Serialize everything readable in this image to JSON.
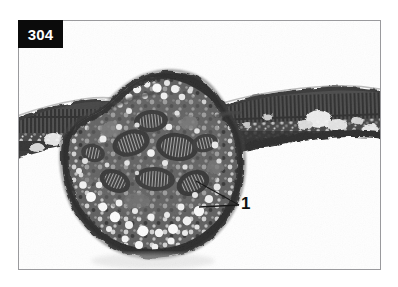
{
  "figure": {
    "number_badge": "304",
    "caption_annotations": [
      {
        "id": "1",
        "label": "1",
        "x": 241,
        "y": 195
      }
    ],
    "colors": {
      "badge_background": "#0b0b0b",
      "badge_text": "#ffffff",
      "frame_border": "#9a9a9d",
      "background": "#ffffff",
      "tissue_dark": "#141414",
      "tissue_mid": "#575757",
      "tissue_light": "#d8d8d8",
      "vesicle_highlight": "#f7f7f7",
      "leader_line": "#1a1a1a"
    },
    "frame": {
      "x": 18,
      "y": 20,
      "width": 363,
      "height": 250
    },
    "image_type": "light-micrograph",
    "leader_lines": [
      {
        "from_x": 239,
        "from_y": 205,
        "to_x": 196,
        "to_y": 181
      },
      {
        "from_x": 239,
        "from_y": 205,
        "to_x": 199,
        "to_y": 207
      }
    ],
    "structures": {
      "lamina_label": "leaf lamina",
      "gall_label": "gall nodule",
      "palisade_label": "palisade layer"
    }
  }
}
